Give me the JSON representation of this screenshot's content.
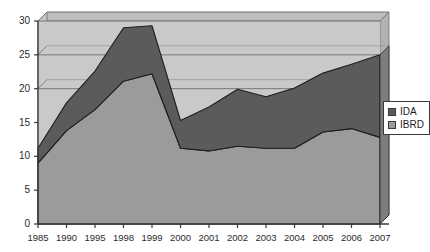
{
  "chart_data": {
    "type": "area",
    "stacked": true,
    "title": "",
    "subtitle": "",
    "xlabel": "",
    "ylabel": "",
    "categories": [
      "1985",
      "1990",
      "1995",
      "1998",
      "1999",
      "2000",
      "2001",
      "2002",
      "2003",
      "2004",
      "2005",
      "2006",
      "2007"
    ],
    "series": [
      {
        "name": "IBRD",
        "color": "#9b9b9b",
        "values": [
          9.0,
          13.8,
          16.9,
          21.1,
          22.2,
          11.2,
          10.8,
          11.5,
          11.2,
          11.2,
          13.6,
          14.1,
          12.8
        ]
      },
      {
        "name": "IDA",
        "color": "#5b5b5b",
        "values": [
          2.2,
          4.1,
          5.7,
          7.9,
          7.1,
          4.1,
          6.5,
          8.4,
          7.6,
          8.9,
          8.7,
          9.5,
          12.2
        ]
      }
    ],
    "stack_totals": [
      11.2,
      17.9,
      22.6,
      29.0,
      29.3,
      15.3,
      17.3,
      19.9,
      18.8,
      20.1,
      22.3,
      23.6,
      25.0
    ],
    "ylim": [
      0,
      30
    ],
    "yticks": [
      "0",
      "5",
      "10",
      "15",
      "20",
      "25",
      "30"
    ],
    "ytick_values": [
      0,
      5,
      10,
      15,
      20,
      25,
      30
    ],
    "grid": true,
    "gridlines_at": [
      20,
      25,
      30
    ],
    "legend_position": "right",
    "legend_entries": [
      "IDA",
      "IBRD"
    ],
    "plot_background": "#c9c9c9",
    "axis_color": "#3a3a3a",
    "series_outline": "#1e1e1e"
  },
  "legend": {
    "items": [
      {
        "label": "IDA",
        "color": "#5b5b5b"
      },
      {
        "label": "IBRD",
        "color": "#9b9b9b"
      }
    ]
  }
}
